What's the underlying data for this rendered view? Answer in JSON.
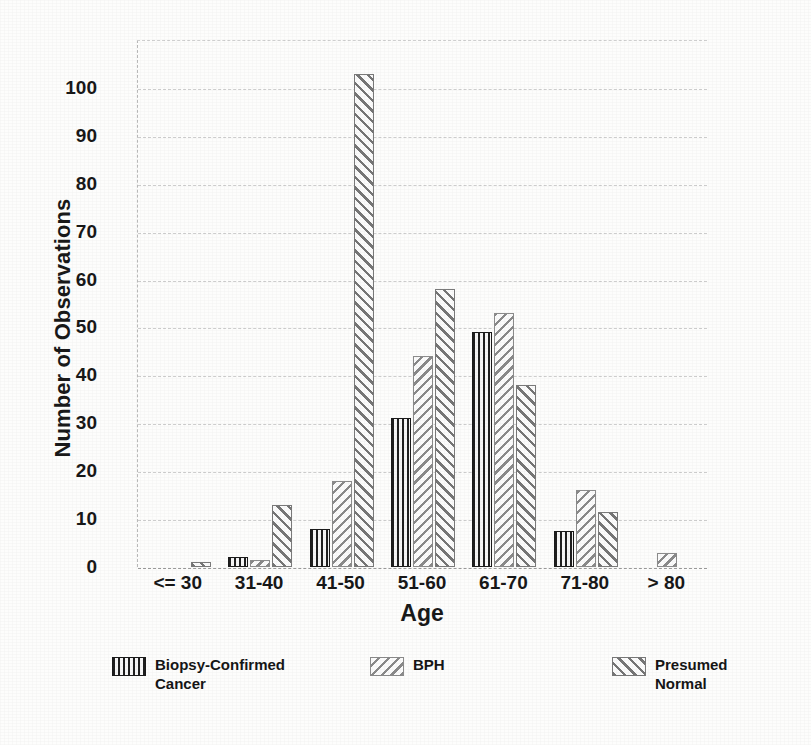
{
  "chart_data": {
    "type": "bar",
    "title": "",
    "xlabel": "Age",
    "ylabel": "Number of Observations",
    "categories": [
      "<= 30",
      "31-40",
      "41-50",
      "51-60",
      "61-70",
      "71-80",
      "> 80"
    ],
    "series": [
      {
        "name": "Biopsy-Confirmed\nCancer",
        "legend_label": "Biopsy-Confirmed\nCancer",
        "pattern": "vertical-stripes",
        "values": [
          0,
          2,
          8,
          31,
          49,
          7.5,
          0
        ]
      },
      {
        "name": "BPH",
        "legend_label": "BPH",
        "pattern": "backslash-hatch",
        "values": [
          0,
          1.5,
          18,
          44,
          53,
          16,
          3
        ]
      },
      {
        "name": "Presumed\nNormal",
        "legend_label": "Presumed\nNormal",
        "pattern": "forward-slash-hatch",
        "values": [
          1,
          13,
          103,
          58,
          38,
          11.5,
          0
        ]
      }
    ],
    "ylim": [
      0,
      110
    ],
    "ytick_labels": [
      "0",
      "10",
      "20",
      "30",
      "40",
      "50",
      "60",
      "70",
      "80",
      "90",
      "100"
    ],
    "ytick_values": [
      0,
      10,
      20,
      30,
      40,
      50,
      60,
      70,
      80,
      90,
      100
    ],
    "grid": true,
    "grid_style": "dotted-horizontal",
    "legend_position": "bottom",
    "colors": {
      "series1_ink": "#1f1f1f",
      "series2_ink": "#8a8a8a",
      "series3_ink": "#767676",
      "gridline": "#c5c5c5",
      "text": "#181818",
      "background": "#fdfdfc"
    }
  }
}
